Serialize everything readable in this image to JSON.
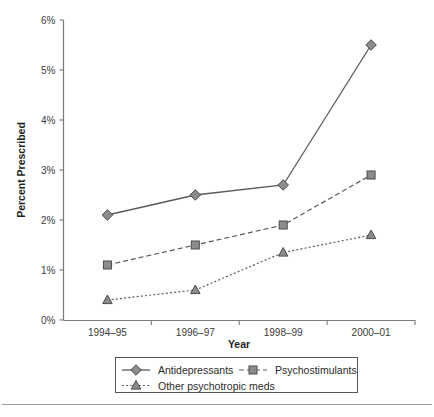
{
  "chart_data": {
    "type": "line",
    "title": "",
    "subtitle": "",
    "xlabel": "Year",
    "ylabel": "Percent Prescribed",
    "categories": [
      "1994–95",
      "1996–97",
      "1998–99",
      "2000–01"
    ],
    "ytick_labels": [
      "0%",
      "1%",
      "2%",
      "3%",
      "4%",
      "5%",
      "6%"
    ],
    "ytick_values": [
      0,
      1,
      2,
      3,
      4,
      5,
      6
    ],
    "ylim": [
      0,
      6
    ],
    "grid": false,
    "legend_position": "bottom",
    "series": [
      {
        "name": "Antidepressants",
        "marker": "diamond",
        "linestyle": "solid",
        "color": "#8c8c8c",
        "values": [
          2.1,
          2.5,
          2.7,
          5.5
        ]
      },
      {
        "name": "Psychostimulants",
        "marker": "square",
        "linestyle": "dashed",
        "color": "#8c8c8c",
        "values": [
          1.1,
          1.5,
          1.9,
          2.9
        ]
      },
      {
        "name": "Other psychotropic meds",
        "marker": "triangle",
        "linestyle": "dotted",
        "color": "#8c8c8c",
        "values": [
          0.4,
          0.6,
          1.35,
          1.7
        ]
      }
    ]
  },
  "legend": {
    "entries": [
      {
        "label": "Antidepressants"
      },
      {
        "label": "Psychostimulants"
      },
      {
        "label": "Other psychotropic meds"
      }
    ]
  },
  "axes": {
    "x_title": "Year",
    "y_title": "Percent Prescribed"
  }
}
